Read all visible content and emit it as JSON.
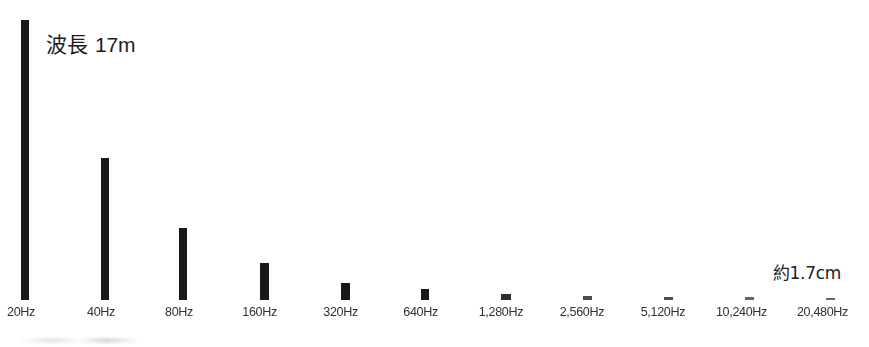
{
  "figure": {
    "background_color": "#ffffff",
    "bar_color": "#17181a",
    "label_color": "#2f3133",
    "callout_max": {
      "prefix": "波長",
      "value": "17m",
      "full": "波長 17m"
    },
    "callout_min": "約1.7cm"
  },
  "chart_data": {
    "type": "bar",
    "title": "",
    "subtitle": "",
    "xlabel": "",
    "ylabel": "",
    "grid": false,
    "legend": null,
    "annotations": [
      {
        "text": "波長 17m",
        "target_category": "20Hz",
        "meaning": "wavelength at 20 Hz"
      },
      {
        "text": "約1.7cm",
        "target_category": "20,480Hz",
        "meaning": "approximately 1.7 cm wavelength at 20,480 Hz"
      }
    ],
    "categories": [
      "20Hz",
      "40Hz",
      "80Hz",
      "160Hz",
      "320Hz",
      "640Hz",
      "1,280Hz",
      "2,560Hz",
      "5,120Hz",
      "10,240Hz",
      "20,480Hz"
    ],
    "frequencies_hz": [
      20,
      40,
      80,
      160,
      320,
      640,
      1280,
      2560,
      5120,
      10240,
      20480
    ],
    "series": [
      {
        "name": "波長",
        "unit": "m",
        "values": [
          17,
          8.5,
          4.25,
          2.125,
          1.0625,
          0.53125,
          0.265625,
          0.1328125,
          0.06640625,
          0.033203125,
          0.017
        ]
      }
    ],
    "values": [
      17,
      8.5,
      4.25,
      2.125,
      1.0625,
      0.53125,
      0.265625,
      0.1328125,
      0.06640625,
      0.033203125,
      0.017
    ],
    "ylim": [
      0,
      17
    ],
    "bar_pixel_heights": [
      280,
      142,
      72,
      37,
      17,
      11,
      6,
      4,
      3,
      3,
      2
    ]
  },
  "bars": [
    {
      "category": "20Hz",
      "left": 21,
      "width": 8,
      "height": 280,
      "label_left": 6,
      "shade": ""
    },
    {
      "category": "40Hz",
      "left": 101,
      "width": 8,
      "height": 142,
      "label_left": 86,
      "shade": ""
    },
    {
      "category": "80Hz",
      "left": 179,
      "width": 8,
      "height": 72,
      "label_left": 164,
      "shade": ""
    },
    {
      "category": "160Hz",
      "left": 260,
      "width": 9,
      "height": 37,
      "label_left": 241,
      "shade": ""
    },
    {
      "category": "320Hz",
      "left": 341,
      "width": 9,
      "height": 17,
      "label_left": 322,
      "shade": ""
    },
    {
      "category": "640Hz",
      "left": 421,
      "width": 8,
      "height": 11,
      "label_left": 402,
      "shade": ""
    },
    {
      "category": "1,280Hz",
      "left": 501,
      "width": 10,
      "height": 6,
      "label_left": 477,
      "shade": "faint-1"
    },
    {
      "category": "2,560Hz",
      "left": 583,
      "width": 9,
      "height": 4,
      "label_left": 558,
      "shade": "faint-2"
    },
    {
      "category": "5,120Hz",
      "left": 664,
      "width": 9,
      "height": 3,
      "label_left": 639,
      "shade": "faint-2"
    },
    {
      "category": "10,240Hz",
      "left": 745,
      "width": 9,
      "height": 3,
      "label_left": 714,
      "shade": "faint-3"
    },
    {
      "category": "20,480Hz",
      "left": 826,
      "width": 9,
      "height": 2,
      "label_left": 795,
      "shade": "faint-3"
    }
  ]
}
